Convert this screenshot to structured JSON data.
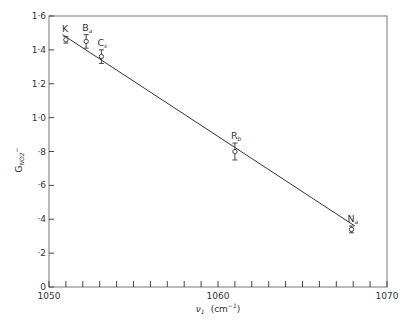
{
  "chart_data": {
    "type": "scatter",
    "title": "",
    "xlabel": "ν1 (cm⁻¹)",
    "ylabel": "G_NO2⁻",
    "xlim": [
      1050,
      1070
    ],
    "ylim": [
      0,
      1.6
    ],
    "x_ticks": [
      {
        "value": 1050,
        "label": "1050"
      },
      {
        "value": 1060,
        "label": "1060"
      },
      {
        "value": 1070,
        "label": "1070"
      }
    ],
    "x_minor_step": 1,
    "y_ticks": [
      {
        "value": 0,
        "label": "0"
      },
      {
        "value": 0.2,
        "label": "·2"
      },
      {
        "value": 0.4,
        "label": "·4"
      },
      {
        "value": 0.6,
        "label": "·6"
      },
      {
        "value": 0.8,
        "label": "·8"
      },
      {
        "value": 1.0,
        "label": "1·0"
      },
      {
        "value": 1.2,
        "label": "1·2"
      },
      {
        "value": 1.4,
        "label": "1·4"
      },
      {
        "value": 1.6,
        "label": "1·6"
      }
    ],
    "grid": false,
    "legend": null,
    "series": [
      {
        "name": "G_NO2- vs nu1",
        "points": [
          {
            "label": "K",
            "sub": "",
            "x": 1051.0,
            "y": 1.46,
            "err": 0.02
          },
          {
            "label": "B",
            "sub": "a",
            "x": 1052.2,
            "y": 1.45,
            "err": 0.04
          },
          {
            "label": "C",
            "sub": "s",
            "x": 1053.1,
            "y": 1.36,
            "err": 0.04
          },
          {
            "label": "R",
            "sub": "b",
            "x": 1061.0,
            "y": 0.8,
            "err": 0.05
          },
          {
            "label": "N",
            "sub": "a",
            "x": 1067.9,
            "y": 0.34,
            "err": 0.02
          }
        ]
      }
    ],
    "fit_line": {
      "x": [
        1050.8,
        1068.1
      ],
      "y": [
        1.49,
        0.36
      ]
    }
  }
}
